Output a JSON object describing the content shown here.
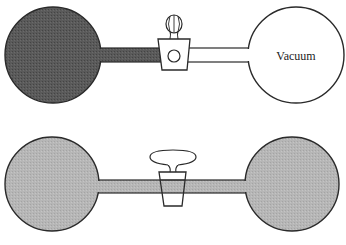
{
  "diagram": {
    "colors": {
      "dark_gas": "#555555",
      "light_gas": "#b4b4b4",
      "vacuum": "#ffffff",
      "stroke": "#2a2a2a",
      "background": "#ffffff"
    },
    "top_apparatus": {
      "state": "stopcock closed",
      "left_bulb": {
        "content": "gas (dense)",
        "fill": "dark"
      },
      "right_bulb": {
        "content": "vacuum",
        "label": "Vacuum"
      },
      "stopcock": {
        "state": "closed"
      }
    },
    "bottom_apparatus": {
      "state": "stopcock open",
      "left_bulb": {
        "content": "gas (expanded)",
        "fill": "light"
      },
      "right_bulb": {
        "content": "gas (expanded)",
        "fill": "light"
      },
      "stopcock": {
        "state": "open"
      }
    }
  }
}
